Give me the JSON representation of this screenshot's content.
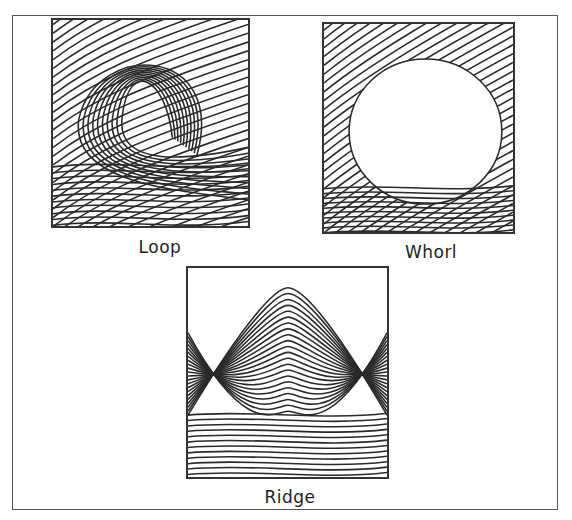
{
  "figure": {
    "panels": [
      {
        "id": "loop",
        "label": "Loop"
      },
      {
        "id": "whorl",
        "label": "Whorl"
      },
      {
        "id": "ridge",
        "label": "Ridge"
      }
    ]
  },
  "colors": {
    "line": "#2a2a2a",
    "frame": "#555555",
    "background": "#ffffff"
  }
}
